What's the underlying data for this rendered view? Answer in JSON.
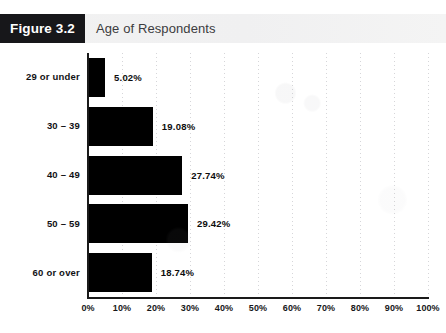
{
  "header": {
    "badge_label": "Figure 3.2",
    "title": "Age of Respondents",
    "badge_color": "#17171a",
    "band_color": "#f1f1f2"
  },
  "chart_data": {
    "type": "bar",
    "orientation": "horizontal",
    "title": "Age of Respondents",
    "xlabel": "",
    "ylabel": "",
    "xlim": [
      0,
      100
    ],
    "grid": true,
    "legend": "none",
    "bar_color": "#000000",
    "categories": [
      "29 or under",
      "30 – 39",
      "40 – 49",
      "50 – 59",
      "60 or over"
    ],
    "values": [
      5.02,
      19.08,
      27.74,
      29.42,
      18.74
    ],
    "value_labels": [
      "5.02%",
      "19.08%",
      "27.74%",
      "29.42%",
      "18.74%"
    ],
    "xticks": [
      0,
      10,
      20,
      30,
      40,
      50,
      60,
      70,
      80,
      90,
      100
    ],
    "xtick_labels": [
      "0%",
      "10%",
      "20%",
      "30%",
      "40%",
      "50%",
      "60%",
      "70%",
      "80%",
      "90%",
      "100%"
    ]
  }
}
